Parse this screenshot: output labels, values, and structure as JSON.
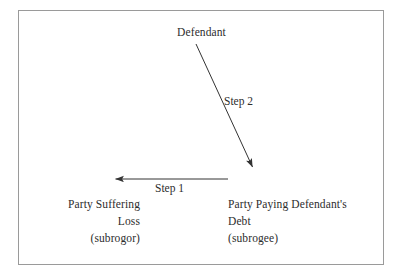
{
  "diagram": {
    "frame": {
      "border_color": "#9a9a9a",
      "background_color": "#ffffff"
    },
    "text_color": "#2d2d2d",
    "nodes": {
      "defendant": {
        "label": "Defendant"
      },
      "subrogor": {
        "line1": "Party Suffering",
        "line2": "Loss",
        "line3": "(subrogor)"
      },
      "subrogee": {
        "line1": "Party Paying Defendant's",
        "line2": "Debt",
        "line3": "(subrogee)"
      }
    },
    "edges": {
      "step1": {
        "label": "Step 1",
        "from": "subrogee",
        "to": "subrogor",
        "direction": "left",
        "stroke_color": "#333333"
      },
      "step2": {
        "label": "Step 2",
        "from": "defendant",
        "to": "subrogee",
        "direction": "down-right",
        "stroke_color": "#333333"
      }
    }
  }
}
